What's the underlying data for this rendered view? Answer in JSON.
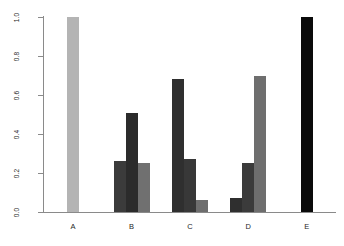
{
  "chart_data": {
    "type": "bar",
    "title": "",
    "subtitle": "",
    "xlabel": "",
    "ylabel": "",
    "categories": [
      "A",
      "B",
      "C",
      "D",
      "E"
    ],
    "ylim": [
      0.0,
      1.0
    ],
    "yticks": [
      0.0,
      0.2,
      0.4,
      0.6,
      0.8,
      1.0
    ],
    "ytick_labels": [
      "0.0",
      "0.2",
      "0.4",
      "0.6",
      "0.8",
      "1.0"
    ],
    "grid": false,
    "legend": false,
    "legend_position": "none",
    "grouped": true,
    "series": [
      {
        "name": "series-1",
        "color": "#3b3b3b",
        "values": [
          null,
          0.26,
          0.68,
          0.07,
          null
        ]
      },
      {
        "name": "series-2",
        "color": "#2b2b2b",
        "values": [
          null,
          0.51,
          0.27,
          0.25,
          null
        ]
      },
      {
        "name": "series-3",
        "color": "#707070",
        "values": [
          null,
          0.25,
          0.06,
          0.7,
          null
        ]
      },
      {
        "name": "series-single-a",
        "color": "#b4b4b4",
        "values": [
          1.0,
          null,
          null,
          null,
          null
        ]
      },
      {
        "name": "series-single-e",
        "color": "#0a0a0a",
        "values": [
          null,
          null,
          null,
          null,
          1.0
        ]
      }
    ],
    "bars": [
      {
        "category": "A",
        "index": 0,
        "value": 1.0,
        "color": "#b4b4b4"
      },
      {
        "category": "B",
        "index": 0,
        "value": 0.26,
        "color": "#3b3b3b"
      },
      {
        "category": "B",
        "index": 1,
        "value": 0.51,
        "color": "#2b2b2b"
      },
      {
        "category": "B",
        "index": 2,
        "value": 0.25,
        "color": "#707070"
      },
      {
        "category": "C",
        "index": 0,
        "value": 0.68,
        "color": "#2f2f2f"
      },
      {
        "category": "C",
        "index": 1,
        "value": 0.27,
        "color": "#383838"
      },
      {
        "category": "C",
        "index": 2,
        "value": 0.06,
        "color": "#6e6e6e"
      },
      {
        "category": "D",
        "index": 0,
        "value": 0.07,
        "color": "#2f2f2f"
      },
      {
        "category": "D",
        "index": 1,
        "value": 0.25,
        "color": "#3b3b3b"
      },
      {
        "category": "D",
        "index": 2,
        "value": 0.7,
        "color": "#6e6e6e"
      },
      {
        "category": "E",
        "index": 0,
        "value": 1.0,
        "color": "#0a0a0a"
      }
    ],
    "axis_color": "#8a8a8a",
    "background_color": "#ffffff"
  }
}
